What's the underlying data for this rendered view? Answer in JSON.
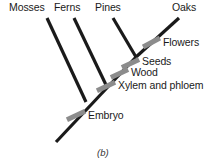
{
  "figure": {
    "caption": "(b)",
    "caption_x": 97,
    "caption_y": 147,
    "width": 218,
    "height": 164,
    "background": "#ffffff",
    "branch_color": "#1a1a1a",
    "branch_width": 3.2,
    "marker_color": "#8c8c8c",
    "text_color": "#1a1a1a"
  },
  "taxa": [
    {
      "name": "mosses",
      "label": "Mosses",
      "x": 9,
      "y": 2
    },
    {
      "name": "ferns",
      "label": "Ferns",
      "x": 54,
      "y": 2
    },
    {
      "name": "pines",
      "label": "Pines",
      "x": 95,
      "y": 2
    },
    {
      "name": "oaks",
      "label": "Oaks",
      "x": 172,
      "y": 2
    }
  ],
  "traits": [
    {
      "name": "flowers",
      "label": "Flowers",
      "x": 163,
      "y": 37,
      "bar_x": 142,
      "bar_y": 40,
      "bar_w": 19,
      "bar_h": 5,
      "bar_rot": -28
    },
    {
      "name": "seeds",
      "label": "Seeds",
      "x": 142,
      "y": 56,
      "bar_x": 121,
      "bar_y": 61,
      "bar_w": 19,
      "bar_h": 5,
      "bar_rot": -25
    },
    {
      "name": "wood",
      "label": "Wood",
      "x": 131,
      "y": 67,
      "bar_x": 110,
      "bar_y": 71,
      "bar_w": 19,
      "bar_h": 5,
      "bar_rot": -25
    },
    {
      "name": "xylem-and-phloem",
      "label": "Xylem and phloem",
      "x": 118,
      "y": 80,
      "bar_x": 96,
      "bar_y": 84,
      "bar_w": 20,
      "bar_h": 5,
      "bar_rot": -25
    },
    {
      "name": "embryo",
      "label": "Embryo",
      "x": 88,
      "y": 110,
      "bar_x": 66,
      "bar_y": 113,
      "bar_w": 20,
      "bar_h": 5,
      "bar_rot": -25
    }
  ],
  "branches": [
    {
      "name": "backbone-root",
      "x1": 56,
      "y1": 142,
      "x2": 136,
      "y2": 57
    },
    {
      "name": "mosses-branch",
      "x1": 86,
      "y1": 102,
      "x2": 47,
      "y2": 18
    },
    {
      "name": "ferns-branch",
      "x1": 107,
      "y1": 87,
      "x2": 74,
      "y2": 18
    },
    {
      "name": "pines-branch",
      "x1": 136,
      "y1": 57,
      "x2": 113,
      "y2": 18
    },
    {
      "name": "oaks-branch",
      "x1": 136,
      "y1": 57,
      "x2": 179,
      "y2": 18
    }
  ]
}
